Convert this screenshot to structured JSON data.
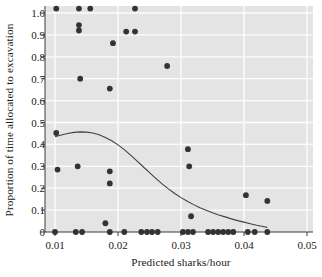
{
  "chart_data": {
    "type": "scatter",
    "title": "",
    "xlabel": "Predicted sharks/hour",
    "ylabel": "Proportion of time allocated to excavation",
    "xlim": [
      0.01,
      0.05
    ],
    "ylim": [
      -0.04,
      1.05
    ],
    "xticks": [
      0.01,
      0.02,
      0.03,
      0.04,
      0.05
    ],
    "xtick_labels": [
      "0.01",
      "0.02",
      "0.03",
      "0.04",
      "0.05"
    ],
    "yticks": [
      0,
      0.1,
      0.2,
      0.3,
      0.4,
      0.5,
      0.6,
      0.7,
      0.8,
      0.9,
      1.0
    ],
    "ytick_labels": [
      "0",
      "0.1",
      "0.2",
      "0.3",
      "0.4",
      "0.5",
      "0.6",
      "0.7",
      "0.8",
      "0.9",
      "1.0"
    ],
    "grid": "horizontal-and-vertical-white-on-gray",
    "plot_background": "#e4e4e4",
    "point_color": "#333333",
    "line_color": "#404040",
    "legend": null,
    "points": [
      {
        "x": 0.0102,
        "y": 1.02
      },
      {
        "x": 0.0138,
        "y": 1.02
      },
      {
        "x": 0.0156,
        "y": 1.02
      },
      {
        "x": 0.0227,
        "y": 1.02
      },
      {
        "x": 0.0138,
        "y": 0.945
      },
      {
        "x": 0.0138,
        "y": 0.92
      },
      {
        "x": 0.0213,
        "y": 0.915
      },
      {
        "x": 0.0227,
        "y": 0.915
      },
      {
        "x": 0.0192,
        "y": 0.862
      },
      {
        "x": 0.0278,
        "y": 0.758
      },
      {
        "x": 0.014,
        "y": 0.7
      },
      {
        "x": 0.0187,
        "y": 0.655
      },
      {
        "x": 0.0102,
        "y": 0.452
      },
      {
        "x": 0.0104,
        "y": 0.285
      },
      {
        "x": 0.0136,
        "y": 0.3
      },
      {
        "x": 0.0187,
        "y": 0.277
      },
      {
        "x": 0.0187,
        "y": 0.222
      },
      {
        "x": 0.0311,
        "y": 0.378
      },
      {
        "x": 0.0313,
        "y": 0.3
      },
      {
        "x": 0.0403,
        "y": 0.168
      },
      {
        "x": 0.0437,
        "y": 0.142
      },
      {
        "x": 0.0316,
        "y": 0.072
      },
      {
        "x": 0.018,
        "y": 0.04
      },
      {
        "x": 0.01,
        "y": 0.0
      },
      {
        "x": 0.0133,
        "y": 0.0
      },
      {
        "x": 0.0143,
        "y": 0.0
      },
      {
        "x": 0.0187,
        "y": 0.0
      },
      {
        "x": 0.021,
        "y": 0.0
      },
      {
        "x": 0.0237,
        "y": 0.0
      },
      {
        "x": 0.0246,
        "y": 0.0
      },
      {
        "x": 0.0254,
        "y": 0.0
      },
      {
        "x": 0.0263,
        "y": 0.0
      },
      {
        "x": 0.0303,
        "y": 0.0
      },
      {
        "x": 0.0311,
        "y": 0.0
      },
      {
        "x": 0.0319,
        "y": 0.0
      },
      {
        "x": 0.0343,
        "y": 0.0
      },
      {
        "x": 0.0351,
        "y": 0.0
      },
      {
        "x": 0.0359,
        "y": 0.0
      },
      {
        "x": 0.0367,
        "y": 0.0
      },
      {
        "x": 0.0375,
        "y": 0.0
      },
      {
        "x": 0.0383,
        "y": 0.0
      },
      {
        "x": 0.0406,
        "y": 0.0
      },
      {
        "x": 0.0417,
        "y": 0.0
      },
      {
        "x": 0.0437,
        "y": 0.0
      }
    ],
    "fit_curve": [
      {
        "x": 0.01,
        "y": 0.435
      },
      {
        "x": 0.011,
        "y": 0.443
      },
      {
        "x": 0.012,
        "y": 0.45
      },
      {
        "x": 0.013,
        "y": 0.455
      },
      {
        "x": 0.014,
        "y": 0.457
      },
      {
        "x": 0.015,
        "y": 0.456
      },
      {
        "x": 0.016,
        "y": 0.452
      },
      {
        "x": 0.017,
        "y": 0.444
      },
      {
        "x": 0.018,
        "y": 0.432
      },
      {
        "x": 0.019,
        "y": 0.417
      },
      {
        "x": 0.02,
        "y": 0.398
      },
      {
        "x": 0.021,
        "y": 0.376
      },
      {
        "x": 0.022,
        "y": 0.351
      },
      {
        "x": 0.023,
        "y": 0.325
      },
      {
        "x": 0.024,
        "y": 0.298
      },
      {
        "x": 0.025,
        "y": 0.271
      },
      {
        "x": 0.026,
        "y": 0.245
      },
      {
        "x": 0.027,
        "y": 0.22
      },
      {
        "x": 0.028,
        "y": 0.197
      },
      {
        "x": 0.029,
        "y": 0.176
      },
      {
        "x": 0.03,
        "y": 0.157
      },
      {
        "x": 0.031,
        "y": 0.14
      },
      {
        "x": 0.032,
        "y": 0.125
      },
      {
        "x": 0.033,
        "y": 0.111
      },
      {
        "x": 0.034,
        "y": 0.099
      },
      {
        "x": 0.035,
        "y": 0.088
      },
      {
        "x": 0.036,
        "y": 0.078
      },
      {
        "x": 0.037,
        "y": 0.069
      },
      {
        "x": 0.038,
        "y": 0.06
      },
      {
        "x": 0.039,
        "y": 0.052
      },
      {
        "x": 0.04,
        "y": 0.045
      },
      {
        "x": 0.041,
        "y": 0.038
      },
      {
        "x": 0.042,
        "y": 0.031
      },
      {
        "x": 0.043,
        "y": 0.025
      },
      {
        "x": 0.0437,
        "y": 0.021
      }
    ]
  }
}
